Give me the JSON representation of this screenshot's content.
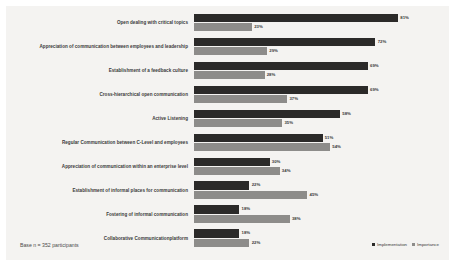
{
  "chart_data": {
    "type": "bar",
    "title": "",
    "subtitle": "",
    "xlabel": "",
    "ylabel": "",
    "orientation": "horizontal",
    "grid": false,
    "legend_position": "bottom-right",
    "xlim": [
      0,
      100
    ],
    "value_suffix": "%",
    "categories": [
      "Open dealing with critical topics",
      "Appreciation of communication between employees and leadership",
      "Establishment of a feedback culture",
      "Cross-hierarchical open communication",
      "Active Listening",
      "Regular Communication between C-Level and employees",
      "Appreciation of communication within an enterprise level",
      "Establishment of informal places for communication",
      "Fostering of informal communication",
      "Collaborative Communicationplatform"
    ],
    "series": [
      {
        "name": "Implementation",
        "color": "#2b2a29",
        "values": [
          81,
          72,
          69,
          69,
          58,
          51,
          30,
          22,
          18,
          18
        ],
        "labels": [
          "81%",
          "72%",
          "69%",
          "69%",
          "58%",
          "51%",
          "30%",
          "22%",
          "18%",
          "18%"
        ]
      },
      {
        "name": "Importance",
        "color": "#8d8c8a",
        "values": [
          23,
          29,
          28,
          37,
          35,
          54,
          34,
          45,
          38,
          22
        ],
        "labels": [
          "23%",
          "29%",
          "28%",
          "37%",
          "35%",
          "54%",
          "34%",
          "45%",
          "38%",
          "22%"
        ]
      }
    ]
  },
  "footnote": {
    "text": "Base n = 352 participants"
  },
  "legend": {
    "items": [
      {
        "label": "Implementation"
      },
      {
        "label": "Importance"
      }
    ]
  },
  "colors": {
    "background": "#f4f3f1",
    "page": "#ffffff",
    "implementation": "#2b2a29",
    "importance": "#8d8c8a",
    "text": "#3a3a3a"
  }
}
